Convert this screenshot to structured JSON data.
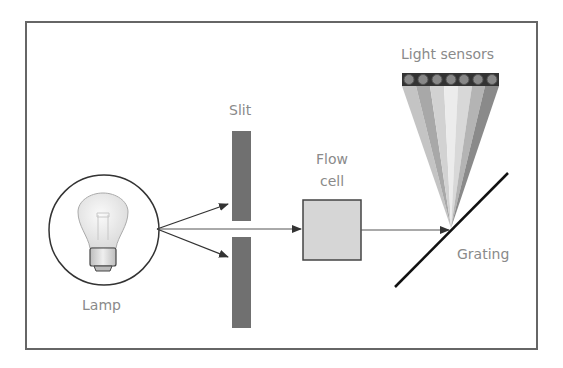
{
  "diagram": {
    "labels": {
      "light_sensors": "Light sensors",
      "slit": "Slit",
      "flow_cell_line1": "Flow",
      "flow_cell_line2": "cell",
      "grating": "Grating",
      "lamp": "Lamp"
    },
    "components": [
      {
        "id": "lamp",
        "label": "Lamp",
        "icon": "lightbulb-icon"
      },
      {
        "id": "slit",
        "label": "Slit"
      },
      {
        "id": "flow_cell",
        "label": "Flow cell"
      },
      {
        "id": "grating",
        "label": "Grating"
      },
      {
        "id": "light_sensors",
        "label": "Light sensors",
        "count": 7
      }
    ],
    "colors": {
      "frame": "#666666",
      "slit": "#707070",
      "flow_cell_fill": "#d6d6d6",
      "label_text": "#8a8a8a",
      "arrow": "#333333",
      "sensor_bg": "#333333",
      "sensor_dot": "#888888",
      "fan": [
        "#c4c4c4",
        "#a8a8a8",
        "#d2d2d2",
        "#ececec",
        "#d8d8d8",
        "#b4b4b4",
        "#8a8a8a"
      ]
    }
  }
}
